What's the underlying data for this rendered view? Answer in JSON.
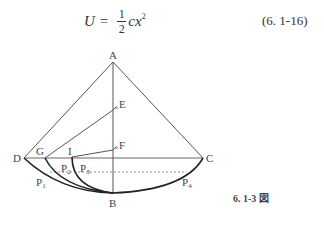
{
  "equation": {
    "lhs": "U",
    "equals": "=",
    "frac_num": "1",
    "frac_den": "2",
    "rhs": "cx",
    "exponent": "2",
    "number": "(6. 1-16)"
  },
  "figure": {
    "labels": {
      "A": "A",
      "B": "B",
      "C": "C",
      "D": "D",
      "E": "E",
      "F": "F",
      "G": "G",
      "I": "I",
      "P1": "P",
      "P1_sub": "1",
      "P2": "P",
      "P2_sub": "2",
      "P3": "P",
      "P3_sub": "3",
      "P4": "P",
      "P4_sub": "4"
    },
    "caption": "6. 1-3 図"
  }
}
